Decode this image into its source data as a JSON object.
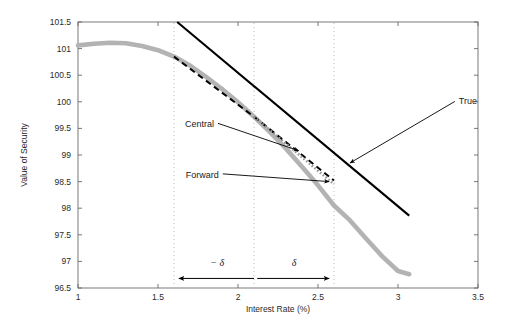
{
  "chart_data": {
    "type": "line",
    "title": "",
    "xlabel": "Interest Rate (%)",
    "ylabel": "Value of Security",
    "xlim": [
      1,
      3.5
    ],
    "ylim": [
      96.5,
      101.5
    ],
    "xticks": [
      "1",
      "1.5",
      "2",
      "2.5",
      "3",
      "3.5"
    ],
    "xtick_values": [
      1,
      1.5,
      2,
      2.5,
      3,
      3.5
    ],
    "yticks": [
      "96.5",
      "97",
      "97.5",
      "98",
      "98.5",
      "99",
      "99.5",
      "100",
      "100.5",
      "101",
      "101.5"
    ],
    "ytick_values": [
      96.5,
      97,
      97.5,
      98,
      98.5,
      99,
      99.5,
      100,
      100.5,
      101,
      101.5
    ],
    "grid": false,
    "legend_position": "none",
    "series": [
      {
        "name": "Price curve",
        "style": "thick-solid",
        "color": "#b3b3b3",
        "x": [
          1.0,
          1.1,
          1.2,
          1.3,
          1.4,
          1.5,
          1.6,
          1.7,
          1.8,
          1.9,
          2.0,
          2.1,
          2.2,
          2.3,
          2.4,
          2.5,
          2.6,
          2.7,
          2.8,
          2.9,
          3.0,
          3.07
        ],
        "y": [
          101.06,
          101.09,
          101.11,
          101.1,
          101.05,
          100.97,
          100.85,
          100.68,
          100.47,
          100.24,
          99.99,
          99.72,
          99.43,
          99.12,
          98.78,
          98.43,
          98.05,
          97.77,
          97.43,
          97.1,
          96.82,
          96.76
        ]
      },
      {
        "name": "True",
        "style": "solid",
        "color": "#000000",
        "x": [
          1.62,
          3.07
        ],
        "y": [
          101.5,
          97.86
        ]
      },
      {
        "name": "Central",
        "style": "dashed",
        "color": "#000000",
        "x": [
          1.6,
          2.1,
          2.6
        ],
        "y": [
          100.85,
          99.72,
          98.52
        ]
      },
      {
        "name": "Forward",
        "style": "dotted",
        "color": "#999999",
        "x": [
          2.1,
          2.6
        ],
        "y": [
          99.72,
          98.45
        ]
      }
    ],
    "vertical_markers": [
      {
        "x": 1.6,
        "label": "-delta bound"
      },
      {
        "x": 2.1,
        "label": "base rate"
      },
      {
        "x": 2.6,
        "label": "+delta bound"
      }
    ],
    "annotations": [
      {
        "id": "true",
        "text": "True",
        "label_x": 3.38,
        "label_y": 99.95,
        "tip_x": 2.7,
        "tip_y": 98.85
      },
      {
        "id": "central",
        "text": "Central",
        "label_x": 1.85,
        "label_y": 99.52,
        "tip_x": 2.38,
        "tip_y": 99.08
      },
      {
        "id": "forward",
        "text": "Forward",
        "label_x": 1.88,
        "label_y": 98.57,
        "tip_x": 2.57,
        "tip_y": 98.5
      },
      {
        "id": "delta-neg",
        "text": "− δ",
        "label_x": 1.87,
        "label_y": 96.92
      },
      {
        "id": "delta-pos",
        "text": "δ",
        "label_x": 2.35,
        "label_y": 96.92
      }
    ]
  },
  "axes": {
    "xlabel": "Interest Rate (%)",
    "ylabel": "Value of Security",
    "xticks": [
      "1",
      "1.5",
      "2",
      "2.5",
      "3",
      "3.5"
    ],
    "yticks": [
      "96.5",
      "97",
      "97.5",
      "98",
      "98.5",
      "99",
      "99.5",
      "100",
      "100.5",
      "101",
      "101.5"
    ]
  },
  "labels": {
    "true": "True",
    "central": "Central",
    "forward": "Forward",
    "delta_neg": "− δ",
    "delta_pos": "δ"
  },
  "colors": {
    "curve": "#b3b3b3",
    "true_line": "#000000",
    "central_line": "#000000",
    "forward_line": "#999999",
    "marker_line": "#bbbbbb",
    "axis": "#555555",
    "background": "#ffffff"
  }
}
